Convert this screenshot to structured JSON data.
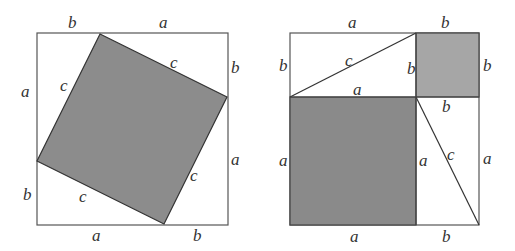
{
  "colors": {
    "shade_dark": "#8a8a8a",
    "shade_light": "#a6a6a6",
    "stroke": "#444444",
    "background": "#ffffff"
  },
  "left_figure": {
    "description": "Square of side a+b with inscribed tilted square of side c",
    "labels": {
      "top_b": "b",
      "top_a": "a",
      "right_b": "b",
      "right_a": "a",
      "bottom_a": "a",
      "bottom_b": "b",
      "left_a": "a",
      "left_b": "b",
      "c_upper_left": "c",
      "c_upper_right": "c",
      "c_lower_left": "c",
      "c_lower_right": "c"
    }
  },
  "right_figure": {
    "description": "Square of side a+b partitioned into a² square, b² square and two a×b rectangles split by diagonal c",
    "labels": {
      "top_a": "a",
      "top_b": "b",
      "left_b": "b",
      "left_a": "a",
      "right_b": "b",
      "right_a": "a",
      "bottom_a": "a",
      "bottom_b": "b",
      "inner_b_vertical": "b",
      "inner_a_horizontal": "a",
      "inner_b_horizontal": "b",
      "inner_a_vertical": "a",
      "diag_c_top": "c",
      "diag_c_right": "c"
    }
  }
}
